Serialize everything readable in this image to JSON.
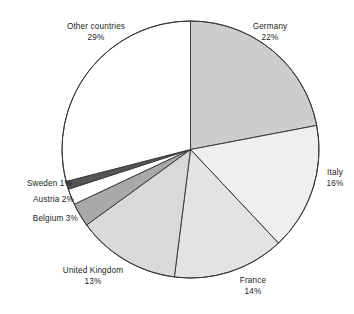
{
  "chart_data": {
    "type": "pie",
    "title": "",
    "subtitle": "",
    "xlabel": "",
    "ylabel": "",
    "legend_position": "none",
    "grid": false,
    "unit": "%",
    "start_angle_deg": 0,
    "direction": "clockwise",
    "categories": [
      "Germany",
      "Italy",
      "France",
      "United Kingdom",
      "Belgium",
      "Austria",
      "Sweden",
      "Other countries"
    ],
    "values": [
      22,
      16,
      14,
      13,
      3,
      2,
      1,
      29
    ],
    "slices": [
      {
        "name": "Germany",
        "value": 22,
        "label_line1": "Germany",
        "label_line2": "22%",
        "color": "#cdcdcd"
      },
      {
        "name": "Italy",
        "value": 16,
        "label_line1": "Italy",
        "label_line2": "16%",
        "color": "#efefef"
      },
      {
        "name": "France",
        "value": 14,
        "label_line1": "France",
        "label_line2": "14%",
        "color": "#e3e3e3"
      },
      {
        "name": "United Kingdom",
        "value": 13,
        "label_line1": "United Kingdom",
        "label_line2": "13%",
        "color": "#d9d9d9"
      },
      {
        "name": "Belgium",
        "value": 3,
        "label_line1": "Belgium 3%",
        "label_line2": "",
        "color": "#a9a9a9"
      },
      {
        "name": "Austria",
        "value": 2,
        "label_line1": "Austria 2%",
        "label_line2": "",
        "color": "#ffffff"
      },
      {
        "name": "Sweden",
        "value": 1,
        "label_line1": "Sweden 1%",
        "label_line2": "",
        "color": "#555555"
      },
      {
        "name": "Other countries",
        "value": 29,
        "label_line1": "Other countries",
        "label_line2": "29%",
        "color": "#ffffff"
      }
    ],
    "outline_color": "#3a3a3a",
    "background_color": "#ffffff"
  },
  "labels": {
    "germany_line1": "Germany",
    "germany_line2": "22%",
    "italy_line1": "Italy",
    "italy_line2": "16%",
    "france_line1": "France",
    "france_line2": "14%",
    "uk_line1": "United Kingdom",
    "uk_line2": "13%",
    "belgium": "Belgium 3%",
    "austria": "Austria 2%",
    "sweden": "Sweden 1%",
    "other_line1": "Other countries",
    "other_line2": "29%"
  }
}
